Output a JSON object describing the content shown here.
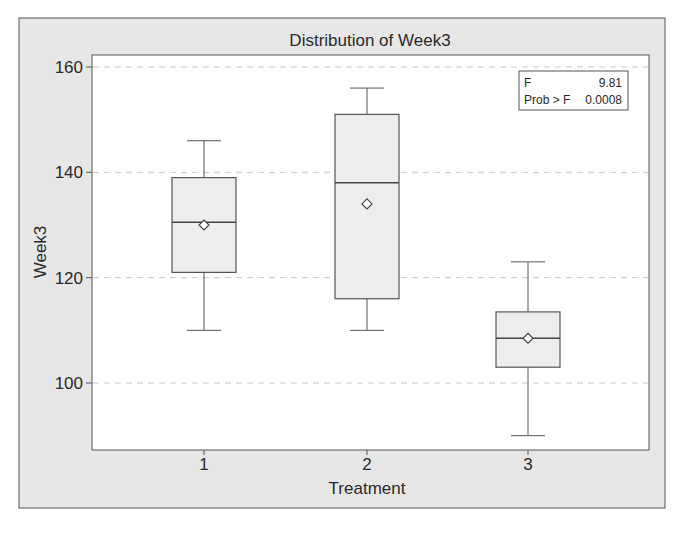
{
  "chart_data": {
    "type": "box",
    "title": "Distribution of Week3",
    "xlabel": "Treatment",
    "ylabel": "Week3",
    "ylim": [
      87.5,
      161.5
    ],
    "yticks": [
      100,
      120,
      140,
      160
    ],
    "ytick_labels": [
      "100",
      "120",
      "140",
      "160"
    ],
    "categories": [
      "1",
      "2",
      "3"
    ],
    "grid": {
      "horizontal": true,
      "style": "dashed",
      "at": [
        100,
        120,
        140,
        160
      ]
    },
    "series": [
      {
        "name": "1",
        "whisker_low": 110,
        "q1": 121,
        "median": 130.5,
        "q3": 139,
        "whisker_high": 146,
        "mean": 130
      },
      {
        "name": "2",
        "whisker_low": 110,
        "q1": 116,
        "median": 138,
        "q3": 151,
        "whisker_high": 156,
        "mean": 134
      },
      {
        "name": "3",
        "whisker_low": 90,
        "q1": 103,
        "median": 108.5,
        "q3": 113.5,
        "whisker_high": 123,
        "mean": 108.5
      }
    ],
    "inset": {
      "position": "top-right",
      "rows": [
        {
          "label": "F",
          "value": "9.81"
        },
        {
          "label": "Prob > F",
          "value": "0.0008"
        }
      ]
    },
    "colors": {
      "frame_background": "#e7e7e7",
      "plot_background": "#ffffff",
      "box_fill": "#ededed",
      "line": "#555555",
      "grid": "#c8c8c8",
      "text": "#2a2a2a"
    }
  }
}
